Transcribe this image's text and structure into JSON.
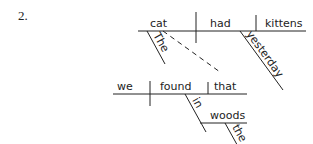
{
  "item_number": "2.",
  "main_clause": {
    "subject": "cat",
    "verb": "had",
    "object": "kittens",
    "modifiers": {
      "subject_article": "The",
      "verb_adverb": "yesterday"
    }
  },
  "relative_clause": {
    "subject": "we",
    "verb": "found",
    "object": "that",
    "prepositional_phrase": {
      "preposition": "in",
      "object": "woods",
      "article": "the"
    }
  },
  "connector": {
    "style": "dashed",
    "from": "cat",
    "to": "that"
  },
  "colors": {
    "ink": "#222222",
    "background": "#ffffff"
  }
}
